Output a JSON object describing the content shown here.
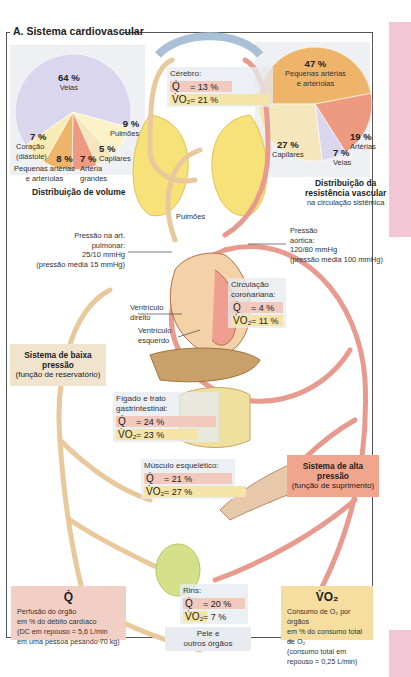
{
  "section_title": "A. Sistema cardiovascular",
  "colors": {
    "veins": "#d9d6ee",
    "small_arteries": "#eeb56a",
    "arteries": "#ed9a80",
    "capillaries": "#f6e6bb",
    "heart": "#f6ecb4",
    "lungs": "#fbf2c8",
    "q_row": "#f1c9bd",
    "v_row": "#f6e3a8",
    "high_pressure_box": "#f2a58d",
    "low_pressure_box": "#f1e4cf",
    "vo2_box": "#f6dea0",
    "q_box": "#f2cfc4",
    "accent_pink": "#f3c6d6"
  },
  "volume_chart": {
    "title": "Distribuição de volume",
    "slices": [
      {
        "label": "Veias",
        "value": "64 %"
      },
      {
        "label": "Pulmões",
        "value": "9 %"
      },
      {
        "label": "Capilares",
        "value": "5 %"
      },
      {
        "label": "Artéria grandes",
        "label_lines": [
          "Artéria",
          "grandes"
        ],
        "value": "7 %"
      },
      {
        "label": "Pequenas artérias e arteríolas",
        "label_lines": [
          "Pequenas artérias",
          "e arteríolas"
        ],
        "value": "8 %"
      },
      {
        "label": "Coração (diástole)",
        "label_lines": [
          "Coração",
          "(diástole)"
        ],
        "value": "7 %"
      }
    ]
  },
  "resistance_chart": {
    "title_lines": [
      "Distribuição da",
      "resistência vascular"
    ],
    "subtitle": "na circulação sistêmica",
    "slices": [
      {
        "label": "Pequenas artérias e arteríolas",
        "label_lines": [
          "Pequenas artérias",
          "e arteríolas"
        ],
        "value": "47 %"
      },
      {
        "label": "Artérias",
        "value": "19 %"
      },
      {
        "label": "Veias",
        "value": "7 %"
      },
      {
        "label": "Capilares",
        "value": "27 %"
      }
    ]
  },
  "chart_data": [
    {
      "type": "pie",
      "title": "Distribuição de volume",
      "categories": [
        "Veias",
        "Pulmões",
        "Capilares",
        "Artéria grandes",
        "Pequenas artérias e arteríolas",
        "Coração (diástole)"
      ],
      "values": [
        64,
        9,
        5,
        7,
        8,
        7
      ],
      "unit": "%"
    },
    {
      "type": "pie",
      "title": "Distribuição da resistência vascular na circulação sistêmica",
      "categories": [
        "Pequenas artérias e arteríolas",
        "Artérias",
        "Veias",
        "Capilares"
      ],
      "values": [
        47,
        19,
        7,
        27
      ],
      "unit": "%"
    }
  ],
  "organs": {
    "brain": {
      "name": "Cérebro:",
      "q": "= 13 %",
      "vo2": "= 21 %"
    },
    "coronary": {
      "name_lines": [
        "Circulação",
        "coronariana:"
      ],
      "q": "=   4 %",
      "vo2": "= 11 %"
    },
    "liver_gi": {
      "name_lines": [
        "Fígado e trato",
        "gastrintestinal:"
      ],
      "q": "= 24 %",
      "vo2": "= 23 %"
    },
    "muscle": {
      "name": "Músculo esquelético:",
      "q": "= 21 %",
      "vo2": "= 27 %"
    },
    "kidneys": {
      "name": "Rins:",
      "q": "= 20 %",
      "vo2": "=    7 %"
    },
    "skin": {
      "name_lines": [
        "Pele e",
        "outros órgãos"
      ]
    }
  },
  "symbols": {
    "q": "Q̇",
    "vo2": "V̇O₂"
  },
  "labels": {
    "lungs": "Pulmões",
    "pulmonary_pressure": [
      "Pressão na art.",
      "pulmonar:",
      "25/10 mmHg",
      "(pressão média 15 mmHg)"
    ],
    "aortic_pressure": [
      "Pressão",
      "aórtica:",
      "120/80 mmHg",
      "(pressão média 100 mmHg)"
    ],
    "right_ventricle": [
      "Ventrículo",
      "direito"
    ],
    "left_ventricle": [
      "Ventrículo",
      "esquerdo"
    ]
  },
  "low_pressure": {
    "title": "Sistema de baixa pressão",
    "subtitle": "(função de reservatório)"
  },
  "high_pressure": {
    "title": "Sistema de alta pressão",
    "subtitle": "(função de suprimento)"
  },
  "q_legend": {
    "symbol": "Q̇",
    "lines": [
      "Perfusão do órgão",
      "em % do débito cardíaco",
      "(DC em repouso = 5,6 L/min",
      "em uma pessoa pesando 70 kg)"
    ]
  },
  "vo2_legend": {
    "symbol": "V̇O₂",
    "lines": [
      "Consumo de O₂ por órgãos",
      "em % do consumo total de O₂",
      "(consumo total em",
      "repouso = 0,25 L/min)"
    ]
  }
}
